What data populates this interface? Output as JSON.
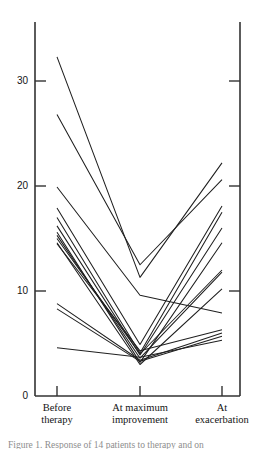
{
  "figure": {
    "background": "#ffffff",
    "line_color": "#1f1f1f",
    "axis_color": "#333333"
  },
  "axes": {
    "y_ticks": [
      "0",
      "10",
      "20",
      "30"
    ],
    "x_tick_labels": [
      {
        "line1": "Before",
        "line2": "therapy"
      },
      {
        "line1": "At maximum",
        "line2": "improvement"
      },
      {
        "line1": "At",
        "line2": "exacerbation"
      }
    ]
  },
  "caption": {
    "text": "Figure 1.  Response of 14 patients to therapy and on"
  },
  "chart_data": {
    "type": "line",
    "title": "",
    "xlabel": "",
    "ylabel": "",
    "categories": [
      "Before therapy",
      "At maximum improvement",
      "At exacerbation"
    ],
    "ylim": [
      0,
      35
    ],
    "yticks": [
      0,
      10,
      20,
      30
    ],
    "grid": false,
    "legend": "none",
    "series": [
      {
        "name": "patient-1",
        "values": [
          32.3,
          11.3,
          22.2
        ]
      },
      {
        "name": "patient-2",
        "values": [
          26.8,
          12.5,
          20.6
        ]
      },
      {
        "name": "patient-3",
        "values": [
          19.9,
          9.6,
          7.9
        ]
      },
      {
        "name": "patient-4",
        "values": [
          17.9,
          4.9,
          18.1
        ]
      },
      {
        "name": "patient-5",
        "values": [
          17.0,
          4.1,
          17.5
        ]
      },
      {
        "name": "patient-6",
        "values": [
          15.6,
          3.2,
          14.6
        ]
      },
      {
        "name": "patient-7",
        "values": [
          15.3,
          3.6,
          11.8
        ]
      },
      {
        "name": "patient-8",
        "values": [
          14.6,
          3.0,
          10.2
        ]
      },
      {
        "name": "patient-9",
        "values": [
          14.5,
          4.3,
          6.3
        ]
      },
      {
        "name": "patient-10",
        "values": [
          8.8,
          3.4,
          6.0
        ]
      },
      {
        "name": "patient-11",
        "values": [
          8.3,
          3.3,
          5.7
        ]
      },
      {
        "name": "patient-12",
        "values": [
          4.6,
          3.7,
          5.3
        ]
      },
      {
        "name": "patient-13",
        "values": [
          15.0,
          4.0,
          12.0
        ]
      },
      {
        "name": "patient-14",
        "values": [
          16.2,
          3.9,
          16.0
        ]
      }
    ]
  }
}
